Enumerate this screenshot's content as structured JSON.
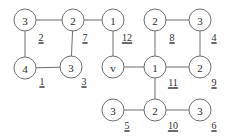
{
  "figure": {
    "name": "labeled-graph-diagram",
    "background_color": "#ffffff",
    "node_stroke_color": "#6e6e6e",
    "node_fill_color": "#ffffff",
    "edge_stroke_color": "#6e6e6e",
    "text_color": "#2b2b2b"
  },
  "chart_data": {
    "type": "diagram",
    "title": "",
    "subtitle": "",
    "xlabel": "",
    "ylabel": "",
    "grid": false,
    "legend": false,
    "components": 2,
    "nodes": [
      {
        "id": "n1",
        "label": "3",
        "x": 25,
        "y": 20,
        "r": 11
      },
      {
        "id": "n2",
        "label": "2",
        "x": 73,
        "y": 20,
        "r": 11
      },
      {
        "id": "n3",
        "label": "1",
        "x": 113,
        "y": 20,
        "r": 11
      },
      {
        "id": "n4",
        "label": "2",
        "x": 155,
        "y": 20,
        "r": 11
      },
      {
        "id": "n5",
        "label": "3",
        "x": 200,
        "y": 20,
        "r": 11
      },
      {
        "id": "n6",
        "label": "4",
        "x": 25,
        "y": 68,
        "r": 11
      },
      {
        "id": "n7",
        "label": "3",
        "x": 71,
        "y": 67,
        "r": 11
      },
      {
        "id": "n8",
        "label": "v",
        "x": 113,
        "y": 67,
        "r": 11
      },
      {
        "id": "n9",
        "label": "1",
        "x": 155,
        "y": 67,
        "r": 11
      },
      {
        "id": "n10",
        "label": "2",
        "x": 200,
        "y": 67,
        "r": 11
      },
      {
        "id": "n11",
        "label": "3",
        "x": 113,
        "y": 110,
        "r": 11
      },
      {
        "id": "n12",
        "label": "2",
        "x": 155,
        "y": 110,
        "r": 11
      },
      {
        "id": "n13",
        "label": "3",
        "x": 200,
        "y": 110,
        "r": 11
      }
    ],
    "edges": [
      {
        "from": "n1",
        "to": "n2",
        "label": "",
        "label_x": 0,
        "label_y": 0
      },
      {
        "from": "n1",
        "to": "n6",
        "label": "2",
        "label_x": 41,
        "label_y": 37
      },
      {
        "from": "n6",
        "to": "n7",
        "label": "1",
        "label_x": 42,
        "label_y": 81
      },
      {
        "from": "n2",
        "to": "n7",
        "label": "3",
        "label_x": 84,
        "label_y": 81
      },
      {
        "from": "n2",
        "to": "n3",
        "label": "7",
        "label_x": 85,
        "label_y": 37
      },
      {
        "from": "n3",
        "to": "n8",
        "label": "12",
        "label_x": 127,
        "label_y": 37
      },
      {
        "from": "n8",
        "to": "n9",
        "label": "",
        "label_x": 0,
        "label_y": 0
      },
      {
        "from": "n4",
        "to": "n5",
        "label": "8",
        "label_x": 172,
        "label_y": 37
      },
      {
        "from": "n4",
        "to": "n9",
        "label": "",
        "label_x": 0,
        "label_y": 0
      },
      {
        "from": "n5",
        "to": "n10",
        "label": "4",
        "label_x": 214,
        "label_y": 37
      },
      {
        "from": "n9",
        "to": "n10",
        "label": "9",
        "label_x": 214,
        "label_y": 82
      },
      {
        "from": "n9",
        "to": "n12",
        "label": "11",
        "label_x": 173,
        "label_y": 82
      },
      {
        "from": "n11",
        "to": "n12",
        "label": "5",
        "label_x": 127,
        "label_y": 125
      },
      {
        "from": "n12",
        "to": "n13",
        "label": "10",
        "label_x": 173,
        "label_y": 125
      },
      {
        "from": "n13",
        "to": "n13",
        "label": "6",
        "label_x": 214,
        "label_y": 125
      }
    ],
    "edge_labels": [
      "2",
      "1",
      "3",
      "7",
      "12",
      "8",
      "4",
      "9",
      "11",
      "5",
      "10",
      "6"
    ],
    "node_labels": [
      "3",
      "2",
      "1",
      "2",
      "3",
      "4",
      "3",
      "v",
      "1",
      "2",
      "3",
      "2",
      "3"
    ]
  }
}
